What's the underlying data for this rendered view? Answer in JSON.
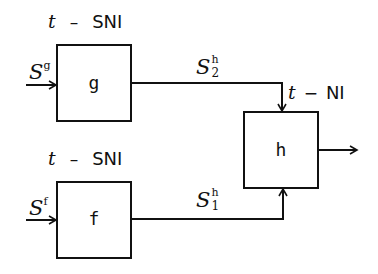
{
  "colors": {
    "stroke": "#111111",
    "background": "#ffffff"
  },
  "boxes": {
    "g": {
      "name": "g",
      "security_label": {
        "var": "t",
        "op": "–",
        "kind": "SNI"
      },
      "input_symbol": "S",
      "input_sup": "g"
    },
    "f": {
      "name": "f",
      "security_label": {
        "var": "t",
        "op": "–",
        "kind": "SNI"
      },
      "input_symbol": "S",
      "input_sup": "f"
    },
    "h": {
      "name": "h",
      "security_label": {
        "var": "t",
        "op": "−",
        "kind": "NI"
      }
    }
  },
  "edges": {
    "g_to_h": {
      "symbol": "S",
      "sup": "h",
      "sub": "2"
    },
    "f_to_h": {
      "symbol": "S",
      "sup": "h",
      "sub": "1"
    }
  }
}
